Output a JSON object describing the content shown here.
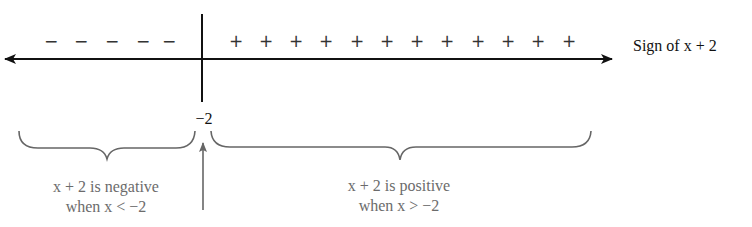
{
  "diagram": {
    "axis_label": "Sign of x + 2",
    "critical_point_label": "−2",
    "negative_signs": [
      "−",
      "−",
      "−",
      "−",
      "−"
    ],
    "positive_signs": [
      "+",
      "+",
      "+",
      "+",
      "+",
      "+",
      "+",
      "+",
      "+",
      "+",
      "+",
      "+"
    ],
    "left_region": {
      "line1": "x + 2 is negative",
      "line2": "when x < −2"
    },
    "right_region": {
      "line1": "x + 2 is positive",
      "line2": "when x > −2"
    },
    "colors": {
      "axis": "#111111",
      "annotation": "#6b6b6b"
    }
  }
}
